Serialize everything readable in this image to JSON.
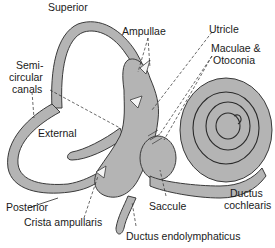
{
  "diagram": {
    "colors": {
      "fill": "#b4b4b4",
      "stroke": "#3a3a3a",
      "text": "#1a1a1a",
      "background": "#ffffff"
    },
    "labels": {
      "superior": "Superior",
      "ampullae": "Ampullae",
      "utricle": "Utricle",
      "maculae_1": "Maculae &",
      "maculae_2": "Otoconia",
      "semicircular_1": "Semi-",
      "semicircular_2": "circular",
      "semicircular_3": "canals",
      "external": "External",
      "posterior": "Posterior",
      "crista": "Crista ampullaris",
      "saccule": "Saccule",
      "ductus_endolymphaticus": "Ductus endolymphaticus",
      "ductus_cochlearis_1": "Ductus",
      "ductus_cochlearis_2": "cochlearis"
    }
  }
}
